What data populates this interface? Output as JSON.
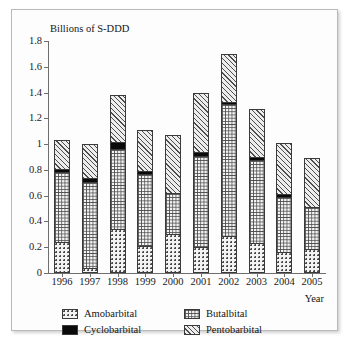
{
  "chart_data": {
    "type": "bar",
    "subtype": "stacked-bar",
    "title": "",
    "ylabel": "Billions of S-DDD",
    "xlabel": "Year",
    "ylim": [
      0,
      1.8
    ],
    "yticks": [
      "0",
      "0.2",
      "0.4",
      "0.6",
      "0.8",
      "1",
      "1.2",
      "1.4",
      "1.6",
      "1.8"
    ],
    "ytick_values": [
      0,
      0.2,
      0.4,
      0.6,
      0.8,
      1.0,
      1.2,
      1.4,
      1.6,
      1.8
    ],
    "grid": false,
    "legend_position": "bottom",
    "categories": [
      "1996",
      "1997",
      "1998",
      "1999",
      "2000",
      "2001",
      "2002",
      "2003",
      "2004",
      "2005"
    ],
    "series": [
      {
        "name": "Amobarbital",
        "pattern": "dots",
        "color": "#f3f3f3",
        "values": [
          0.24,
          0.04,
          0.34,
          0.21,
          0.3,
          0.2,
          0.29,
          0.23,
          0.16,
          0.19
        ]
      },
      {
        "name": "Butalbital",
        "pattern": "grid",
        "color": "#f4f4f4",
        "values": [
          0.54,
          0.67,
          0.62,
          0.56,
          0.32,
          0.71,
          1.02,
          0.65,
          0.43,
          0.32
        ]
      },
      {
        "name": "Cyclobarbital",
        "pattern": "solid",
        "color": "#0a0a0a",
        "values": [
          0.03,
          0.03,
          0.06,
          0.02,
          0.0,
          0.03,
          0.02,
          0.02,
          0.02,
          0.0
        ]
      },
      {
        "name": "Pentobarbital",
        "pattern": "diagonal-hatch",
        "color": "#ededed",
        "values": [
          0.22,
          0.26,
          0.36,
          0.32,
          0.45,
          0.46,
          0.37,
          0.37,
          0.4,
          0.38
        ]
      }
    ],
    "totals": [
      1.03,
      1.0,
      1.38,
      1.11,
      1.07,
      1.4,
      1.7,
      1.27,
      1.01,
      0.89
    ]
  },
  "legend": {
    "entries": [
      {
        "label": "Amobarbital",
        "pattern": "amobarbital"
      },
      {
        "label": "Butalbital",
        "pattern": "butalbital"
      },
      {
        "label": "Cyclobarbital",
        "pattern": "cyclobarbital"
      },
      {
        "label": "Pentobarbital",
        "pattern": "pentobarbital"
      }
    ]
  }
}
